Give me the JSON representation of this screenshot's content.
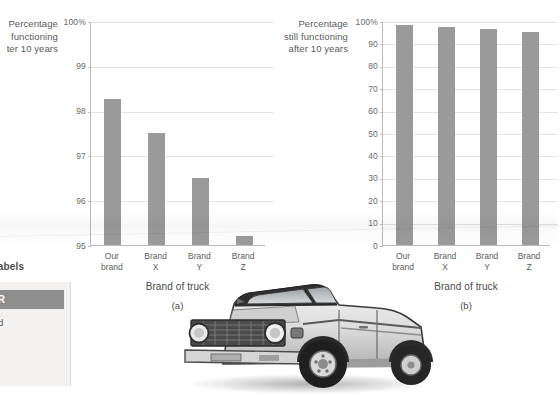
{
  "chart_data": [
    {
      "type": "bar",
      "id": "a",
      "caption": "(a)",
      "title": "",
      "ylabel": "Percentage\nfunctioning\nter 10 years",
      "ylabel_full": "Percentage still functioning after 10 years",
      "xlabel": "Brand of truck",
      "categories": [
        "Our\nbrand",
        "Brand\nX",
        "Brand\nY",
        "Brand\nZ"
      ],
      "category_names": [
        "Our brand",
        "Brand X",
        "Brand Y",
        "Brand Z"
      ],
      "values": [
        98.25,
        97.5,
        96.5,
        95.2
      ],
      "ylim": [
        95,
        100
      ],
      "yticks": [
        95,
        96,
        97,
        98,
        99,
        100
      ],
      "ytick_labels": [
        "95",
        "96",
        "97",
        "98",
        "99",
        "100%"
      ],
      "grid": true,
      "legend": "none",
      "bar_color": "#9a9a9a"
    },
    {
      "type": "bar",
      "id": "b",
      "caption": "(b)",
      "title": "",
      "ylabel": "Percentage\nstill functioning\nafter 10 years",
      "ylabel_full": "Percentage still functioning after 10 years",
      "xlabel": "Brand of truck",
      "categories": [
        "Our\nbrand",
        "Brand\nX",
        "Brand\nY",
        "Brand\nZ"
      ],
      "category_names": [
        "Our brand",
        "Brand X",
        "Brand Y",
        "Brand Z"
      ],
      "values": [
        98.25,
        97.5,
        96.5,
        95.2
      ],
      "ylim": [
        0,
        100
      ],
      "yticks": [
        0,
        10,
        20,
        30,
        40,
        50,
        60,
        70,
        80,
        90,
        100
      ],
      "ytick_labels": [
        "0",
        "10",
        "20",
        "30",
        "40",
        "50",
        "60",
        "70",
        "80",
        "90",
        "100%"
      ],
      "grid": true,
      "legend": "none",
      "bar_color": "#9a9a9a"
    }
  ],
  "sidebar": {
    "scale_labels_heading": "e labels",
    "remember": {
      "header": "MEMBER",
      "header_full": "REMEMBER",
      "body": "cturer offered\nd names\nuch greater\nt does\nthe varying"
    }
  },
  "photo": {
    "caption": "pickup-truck-photo",
    "alt": "Classic pickup truck, three-quarter front view, black and white"
  },
  "colors": {
    "bar": "#9a9a9a",
    "grid": "#e3e3e3",
    "axis": "#b9b9b9",
    "text": "#4a4a4a",
    "remember_header_bg": "#8e8e8e",
    "remember_bg": "#f2f1ef"
  }
}
